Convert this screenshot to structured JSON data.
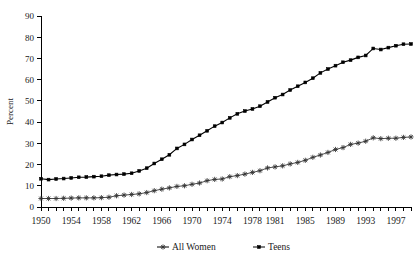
{
  "chart_data": {
    "type": "line",
    "title": "",
    "xlabel": "",
    "ylabel": "Percent",
    "ylim": [
      0,
      90
    ],
    "xlim": [
      1950,
      1999
    ],
    "grid": false,
    "legend_position": "bottom-center",
    "y_ticks": [
      0,
      10,
      20,
      30,
      40,
      50,
      60,
      70,
      80,
      90
    ],
    "x_tick_labels": [
      "1950",
      "1954",
      "1958",
      "1962",
      "1966",
      "1970",
      "1974",
      "1978",
      "1981",
      "1985",
      "1989",
      "1993",
      "1997"
    ],
    "x_tick_years": [
      1950,
      1954,
      1958,
      1962,
      1966,
      1970,
      1974,
      1978,
      1981,
      1985,
      1989,
      1993,
      1997
    ],
    "x_minor_years": [
      1950,
      1951,
      1952,
      1953,
      1954,
      1955,
      1956,
      1957,
      1958,
      1959,
      1960,
      1961,
      1962,
      1963,
      1964,
      1965,
      1966,
      1967,
      1968,
      1969,
      1970,
      1971,
      1972,
      1973,
      1974,
      1975,
      1976,
      1977,
      1978,
      1979,
      1980,
      1981,
      1982,
      1983,
      1984,
      1985,
      1986,
      1987,
      1988,
      1989,
      1990,
      1991,
      1992,
      1993,
      1994,
      1995,
      1996,
      1997,
      1998,
      1999
    ],
    "x": [
      1950,
      1951,
      1952,
      1953,
      1954,
      1955,
      1956,
      1957,
      1958,
      1959,
      1960,
      1961,
      1962,
      1963,
      1964,
      1965,
      1966,
      1967,
      1968,
      1969,
      1970,
      1971,
      1972,
      1973,
      1974,
      1975,
      1976,
      1977,
      1978,
      1979,
      1980,
      1981,
      1982,
      1983,
      1984,
      1985,
      1986,
      1987,
      1988,
      1989,
      1990,
      1991,
      1992,
      1993,
      1994,
      1995,
      1996,
      1997,
      1998,
      1999
    ],
    "series": [
      {
        "name": "All Women",
        "marker": "star",
        "color": "#333333",
        "values": [
          4.0,
          4.0,
          4.0,
          4.1,
          4.2,
          4.3,
          4.3,
          4.3,
          4.4,
          4.6,
          5.3,
          5.6,
          5.9,
          6.2,
          6.8,
          7.7,
          8.4,
          9.0,
          9.7,
          10.0,
          10.7,
          11.3,
          12.4,
          13.0,
          13.2,
          14.3,
          14.8,
          15.5,
          16.3,
          17.1,
          18.4,
          18.9,
          19.4,
          20.3,
          21.0,
          22.0,
          23.4,
          24.5,
          25.7,
          27.1,
          28.0,
          29.5,
          30.1,
          31.0,
          32.6,
          32.2,
          32.4,
          32.4,
          32.8,
          33.0
        ]
      },
      {
        "name": "Teens",
        "marker": "square",
        "color": "#000000",
        "values": [
          13.3,
          12.9,
          13.2,
          13.4,
          13.7,
          14.0,
          14.1,
          14.3,
          14.5,
          15.0,
          15.3,
          15.5,
          15.9,
          17.0,
          18.3,
          20.5,
          22.5,
          24.6,
          27.6,
          29.5,
          31.8,
          33.8,
          35.9,
          38.1,
          39.8,
          42.0,
          43.9,
          45.2,
          46.2,
          47.5,
          49.5,
          51.5,
          53.0,
          55.1,
          56.9,
          58.7,
          60.7,
          63.2,
          65.0,
          66.6,
          68.2,
          69.2,
          70.5,
          71.4,
          74.7,
          74.2,
          75.1,
          76.0,
          76.7,
          76.8
        ]
      }
    ]
  },
  "legend": {
    "items": [
      {
        "label": "All Women",
        "marker": "star"
      },
      {
        "label": "Teens",
        "marker": "square"
      }
    ]
  },
  "axis": {
    "y_title": "Percent"
  }
}
